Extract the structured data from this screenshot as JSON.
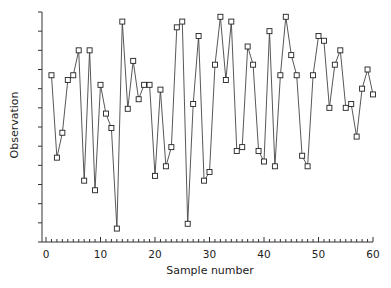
{
  "chart_data": {
    "type": "line",
    "title": "",
    "xlabel": "Sample number",
    "ylabel": "Observation",
    "xlim": [
      0,
      60
    ],
    "ylim": [
      0,
      12
    ],
    "x_ticks": [
      0,
      10,
      20,
      30,
      40,
      50,
      60
    ],
    "x_tick_labels": [
      "0",
      "10",
      "20",
      "30",
      "40",
      "50",
      "60"
    ],
    "y_tick_labels": [],
    "y_tick_count": 13,
    "grid": false,
    "legend": null,
    "marker": "square",
    "series": [
      {
        "name": "Observation",
        "x": [
          1,
          2,
          3,
          4,
          5,
          6,
          7,
          8,
          9,
          10,
          11,
          12,
          13,
          14,
          15,
          16,
          17,
          18,
          19,
          20,
          21,
          22,
          23,
          24,
          25,
          26,
          27,
          28,
          29,
          30,
          31,
          32,
          33,
          34,
          35,
          36,
          37,
          38,
          39,
          40,
          41,
          42,
          43,
          44,
          45,
          46,
          47,
          48,
          49,
          50,
          51,
          52,
          53,
          54,
          55,
          56,
          57,
          58,
          59,
          60
        ],
        "values": [
          8.7,
          4.4,
          5.7,
          8.45,
          8.7,
          10.0,
          3.2,
          10.0,
          2.7,
          8.2,
          6.7,
          5.95,
          0.7,
          11.5,
          6.95,
          9.45,
          7.45,
          8.2,
          8.2,
          3.45,
          7.95,
          3.95,
          4.95,
          11.2,
          11.5,
          0.95,
          7.2,
          10.75,
          3.2,
          3.65,
          9.25,
          11.75,
          8.45,
          11.5,
          4.75,
          4.95,
          10.2,
          9.25,
          4.75,
          4.2,
          11.0,
          3.95,
          8.7,
          11.75,
          9.75,
          8.7,
          4.5,
          3.95,
          8.7,
          10.75,
          10.5,
          7.0,
          9.25,
          10.0,
          7.0,
          7.2,
          5.5,
          8.0,
          9.0,
          7.7
        ]
      }
    ]
  },
  "colors": {
    "line": "#444444",
    "marker_edge": "#222222",
    "axis": "#333333",
    "text": "#222222"
  }
}
